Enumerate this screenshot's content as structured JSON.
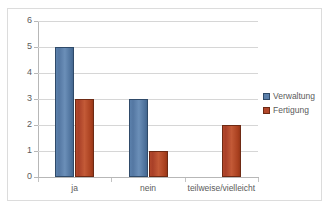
{
  "chart_data": {
    "type": "bar",
    "title": "",
    "xlabel": "",
    "ylabel": "",
    "ylim": [
      0,
      6
    ],
    "ytick_step": 1,
    "yticks": [
      "0",
      "1",
      "2",
      "3",
      "4",
      "5",
      "6"
    ],
    "grid": "horizontal",
    "legend_position": "right",
    "categories": [
      "ja",
      "nein",
      "teilweise/vielleicht"
    ],
    "series": [
      {
        "name": "Verwaltung",
        "color": "#5b80ab",
        "values": [
          5,
          3,
          0
        ]
      },
      {
        "name": "Fertigung",
        "color": "#b2472b",
        "values": [
          3,
          1,
          2
        ]
      }
    ]
  },
  "legend": {
    "items": [
      {
        "label": "Verwaltung",
        "swatch": "legend-swatch-verwaltung"
      },
      {
        "label": "Fertigung",
        "swatch": "legend-swatch-fertigung"
      }
    ]
  },
  "axes": {
    "y_tick_labels": [
      "6",
      "5",
      "4",
      "3",
      "2",
      "1",
      "0"
    ],
    "x_tick_labels": [
      "ja",
      "nein",
      "teilweise/vielleicht"
    ]
  },
  "clipped_title": ""
}
